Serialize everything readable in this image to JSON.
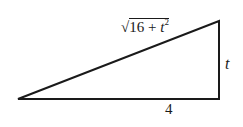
{
  "diagram": {
    "type": "right-triangle",
    "hypotenuse": {
      "radical": "√",
      "expr_num": "16",
      "expr_op": " + ",
      "expr_var": "t",
      "expr_exp": "2"
    },
    "vertical_side": {
      "label": "t"
    },
    "base_side": {
      "label": "4"
    },
    "line_color": "#1a1a1a"
  }
}
